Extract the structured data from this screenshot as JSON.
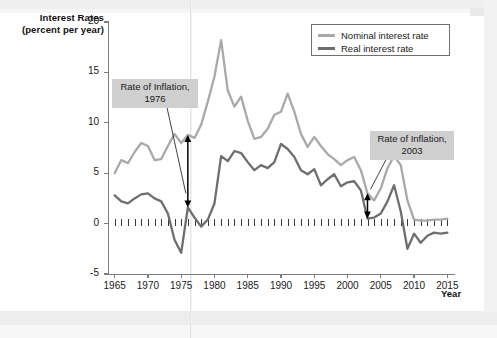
{
  "axis_titles": {
    "y_line1": "Interest Rates",
    "y_line2": "(percent per year)",
    "x": "Year"
  },
  "legend": {
    "items": [
      {
        "label": "Nominal interest rate",
        "color": "#a9a9a9"
      },
      {
        "label": "Real interest rate",
        "color": "#6e6e6e"
      }
    ]
  },
  "annotations": [
    {
      "id": "inflation-1976",
      "line1": "Rate of Inflation,",
      "line2": "1976"
    },
    {
      "id": "inflation-2003",
      "line1": "Rate of Inflation,",
      "line2": "2003"
    }
  ],
  "chart_data": {
    "type": "line",
    "title": "",
    "xlabel": "Year",
    "ylabel": "Interest Rates (percent per year)",
    "xlim": [
      1964,
      2016
    ],
    "ylim": [
      -5,
      20
    ],
    "ytick_labels": [
      "20",
      "15",
      "10",
      "5",
      "0",
      "-5"
    ],
    "ytick_values": [
      20,
      15,
      10,
      5,
      0,
      -5
    ],
    "xtick_labels": [
      "1965",
      "1970",
      "1975",
      "1980",
      "1985",
      "1990",
      "1995",
      "2000",
      "2005",
      "2010",
      "2015"
    ],
    "xtick_values": [
      1965,
      1970,
      1975,
      1980,
      1985,
      1990,
      1995,
      2000,
      2005,
      2010,
      2015
    ],
    "grid": false,
    "legend_position": "top-right",
    "x": [
      1965,
      1966,
      1967,
      1968,
      1969,
      1970,
      1971,
      1972,
      1973,
      1974,
      1975,
      1976,
      1977,
      1978,
      1979,
      1980,
      1981,
      1982,
      1983,
      1984,
      1985,
      1986,
      1987,
      1988,
      1989,
      1990,
      1991,
      1992,
      1993,
      1994,
      1995,
      1996,
      1997,
      1998,
      1999,
      2000,
      2001,
      2002,
      2003,
      2004,
      2005,
      2006,
      2007,
      2008,
      2009,
      2010,
      2011,
      2012,
      2013,
      2014,
      2015
    ],
    "series": [
      {
        "name": "Nominal interest rate",
        "color": "#a9a9a9",
        "values": [
          5.0,
          6.3,
          6.0,
          7.1,
          8.0,
          7.7,
          6.3,
          6.4,
          7.7,
          8.9,
          8.0,
          8.8,
          8.5,
          9.8,
          12.1,
          14.6,
          18.2,
          13.2,
          11.6,
          12.6,
          10.2,
          8.4,
          8.6,
          9.4,
          10.8,
          11.1,
          12.9,
          11.1,
          8.9,
          7.6,
          8.6,
          7.7,
          6.9,
          6.4,
          5.8,
          6.3,
          6.6,
          5.3,
          3.0,
          2.3,
          3.5,
          5.5,
          6.7,
          5.8,
          2.3,
          0.4,
          0.3,
          0.3,
          0.4,
          0.4,
          0.5
        ]
      },
      {
        "name": "Real interest rate",
        "color": "#6e6e6e",
        "values": [
          2.8,
          2.2,
          2.0,
          2.5,
          2.9,
          3.0,
          2.5,
          2.2,
          1.0,
          -1.6,
          -2.9,
          1.6,
          0.6,
          -0.3,
          0.4,
          2.0,
          6.7,
          6.2,
          7.2,
          7.0,
          6.1,
          5.3,
          5.8,
          5.5,
          6.1,
          7.9,
          7.4,
          6.6,
          5.3,
          4.9,
          5.4,
          3.8,
          4.4,
          4.9,
          3.7,
          4.1,
          4.2,
          3.3,
          0.5,
          0.6,
          1.0,
          2.2,
          3.8,
          1.2,
          -2.5,
          -1.0,
          -1.9,
          -1.2,
          -0.9,
          -1.0,
          -0.9
        ]
      }
    ],
    "annotation_arrows": [
      {
        "label": "Rate of Inflation, 1976",
        "year": 1976,
        "top_value": 8.8,
        "bottom_value": 1.6
      },
      {
        "label": "Rate of Inflation, 2003",
        "year": 2003,
        "top_value": 3.0,
        "bottom_value": 0.5
      }
    ]
  }
}
